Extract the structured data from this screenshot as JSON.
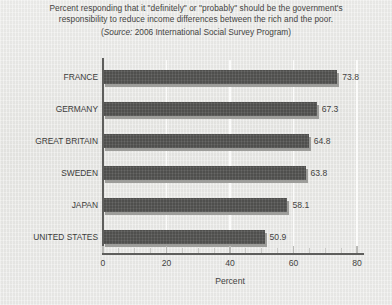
{
  "title": {
    "line1": "Percent responding that it \"definitely\" or \"probably\" should be the government's",
    "line2": "responsibility to reduce income differences between the rich and the poor.",
    "source_prefix": "(",
    "source_word": "Source:",
    "source_rest": " 2006 International Social Survey Program)"
  },
  "chart_data": {
    "type": "bar",
    "orientation": "horizontal",
    "title": "Percent responding that it \"definitely\" or \"probably\" should be the government's responsibility to reduce income differences between the rich and the poor.",
    "subtitle": "(Source: 2006 International Social Survey Program)",
    "source": "2006 International Social Survey Program",
    "categories": [
      "FRANCE",
      "GERMANY",
      "GREAT BRITAIN",
      "SWEDEN",
      "JAPAN",
      "UNITED STATES"
    ],
    "values": [
      73.8,
      67.3,
      64.8,
      63.8,
      58.1,
      50.9
    ],
    "value_labels": [
      "73.8",
      "67.3",
      "64.8",
      "63.8",
      "58.1",
      "50.9"
    ],
    "xlabel": "Percent",
    "ylabel": "",
    "xlim": [
      0,
      80
    ],
    "xticks": [
      0,
      20,
      40,
      60,
      80
    ],
    "xtick_labels": [
      "0",
      "20",
      "40",
      "60",
      "80"
    ],
    "minor_tick_step": 5,
    "grid": "vertical-white",
    "legend": "none",
    "bar_color": "#565654",
    "shadow_color": "#9d9d9a",
    "background_color": "#e9e9e7",
    "axis_color": "#5e5e5c"
  }
}
